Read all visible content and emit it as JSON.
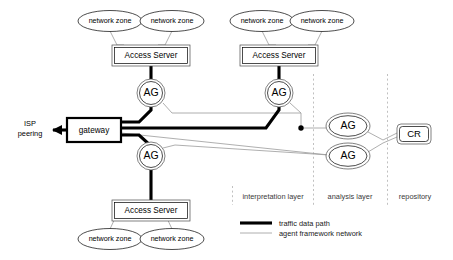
{
  "diagram": {
    "colors": {
      "background": "#ffffff",
      "stroke": "#000000",
      "thin_link": "#9a9a9a",
      "divider": "#b0b0b0",
      "shape_outer": "#4a4a4a"
    },
    "network_zones": [
      {
        "id": "nz1",
        "label": "network zone"
      },
      {
        "id": "nz2",
        "label": "network zone"
      },
      {
        "id": "nz3",
        "label": "network zone"
      },
      {
        "id": "nz4",
        "label": "network zone"
      },
      {
        "id": "nz5",
        "label": "network zone"
      },
      {
        "id": "nz6",
        "label": "network zone"
      }
    ],
    "access_servers": [
      {
        "id": "as1",
        "label": "Access Server"
      },
      {
        "id": "as2",
        "label": "Access Server"
      },
      {
        "id": "as3",
        "label": "Access Server"
      }
    ],
    "agents": [
      {
        "id": "ag1",
        "label": "AG"
      },
      {
        "id": "ag2",
        "label": "AG"
      },
      {
        "id": "ag3",
        "label": "AG"
      },
      {
        "id": "ag4",
        "label": "AG"
      },
      {
        "id": "ag5",
        "label": "AG"
      }
    ],
    "gateway": {
      "id": "gw",
      "label": "gateway"
    },
    "repository_node": {
      "id": "cr",
      "label": "CR"
    },
    "isp": {
      "line1": "ISP",
      "line2": "peering"
    },
    "layers": [
      {
        "id": "interpretation",
        "label": "interpretation layer"
      },
      {
        "id": "analysis",
        "label": "analysis layer"
      },
      {
        "id": "repository",
        "label": "repository"
      }
    ],
    "legend": [
      {
        "id": "traffic",
        "label": "traffic data path",
        "style": "thick"
      },
      {
        "id": "agent-network",
        "label": "agent framework network",
        "style": "thin"
      }
    ]
  }
}
